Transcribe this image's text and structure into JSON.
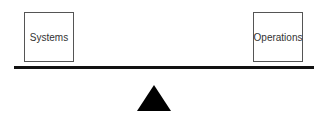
{
  "diagram": {
    "type": "balance-scale",
    "left_box": {
      "label": "Systems"
    },
    "right_box": {
      "label": "Operations"
    },
    "beam": {
      "color": "#111111"
    },
    "fulcrum": {
      "shape": "triangle",
      "color": "#000000"
    }
  }
}
